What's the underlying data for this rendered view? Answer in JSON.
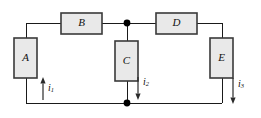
{
  "diagram": {
    "type": "circuit-schematic",
    "canvas": {
      "width": 261,
      "height": 118
    },
    "colors": {
      "background": "#ffffff",
      "wire": "#1a1a1a",
      "box_fill": "#e9e9e9",
      "box_stroke": "#3a3a3a",
      "node": "#000000",
      "arrow": "#2a2a2a",
      "text": "#111111"
    },
    "components": [
      {
        "id": "A",
        "label": "A",
        "orientation": "vertical",
        "x": 14,
        "y": 38,
        "width": 23,
        "height": 40,
        "label_x": 25.5,
        "label_y": 58
      },
      {
        "id": "B",
        "label": "B",
        "orientation": "horizontal",
        "x": 61,
        "y": 13,
        "width": 41,
        "height": 21,
        "label_x": 81.5,
        "label_y": 23.5
      },
      {
        "id": "C",
        "label": "C",
        "orientation": "vertical",
        "x": 115,
        "y": 41,
        "width": 23,
        "height": 40,
        "label_x": 126.5,
        "label_y": 61
      },
      {
        "id": "D",
        "label": "D",
        "orientation": "horizontal",
        "x": 156,
        "y": 13,
        "width": 41,
        "height": 21,
        "label_x": 176.5,
        "label_y": 23.5
      },
      {
        "id": "E",
        "label": "E",
        "orientation": "vertical",
        "x": 210,
        "y": 38,
        "width": 23,
        "height": 40,
        "label_x": 221.5,
        "label_y": 58
      }
    ],
    "nodes": [
      {
        "id": "top-junction",
        "x": 127,
        "y": 23,
        "radius": 3.4
      },
      {
        "id": "bottom-junction",
        "x": 127,
        "y": 103,
        "radius": 3.4
      }
    ],
    "wires": [
      {
        "id": "top-left-to-B",
        "points": "26,23 61,23"
      },
      {
        "id": "B-to-top-junction",
        "points": "102,23 127,23"
      },
      {
        "id": "top-junction-to-D",
        "points": "127,23 156,23"
      },
      {
        "id": "D-to-top-right",
        "points": "197,23 222,23"
      },
      {
        "id": "left-vertical-top",
        "points": "26,23 26,38"
      },
      {
        "id": "left-vertical-bottom",
        "points": "26,78 26,103"
      },
      {
        "id": "right-vertical-top",
        "points": "222,23 222,38"
      },
      {
        "id": "right-vertical-bottom",
        "points": "222,78 222,103"
      },
      {
        "id": "center-vertical-top",
        "points": "127,23 127,41"
      },
      {
        "id": "center-vertical-bottom",
        "points": "127,81 127,103"
      },
      {
        "id": "bottom-left-segment",
        "points": "26,103 127,103"
      },
      {
        "id": "bottom-right-segment",
        "points": "127,103 222,103"
      }
    ],
    "currents": [
      {
        "id": "i1",
        "symbol": "i",
        "subscript": "1",
        "direction": "up",
        "arrow_x": 43,
        "arrow_tail_y": 100,
        "arrow_tip_y": 77,
        "label_x": 48,
        "label_y": 89
      },
      {
        "id": "i2",
        "symbol": "i",
        "subscript": "2",
        "direction": "down",
        "arrow_x": 138,
        "arrow_tail_y": 77,
        "arrow_tip_y": 100,
        "label_x": 143,
        "label_y": 83
      },
      {
        "id": "i3",
        "symbol": "i",
        "subscript": "3",
        "direction": "down",
        "arrow_x": 233,
        "arrow_tail_y": 78,
        "arrow_tip_y": 104,
        "label_x": 238,
        "label_y": 85
      }
    ]
  }
}
